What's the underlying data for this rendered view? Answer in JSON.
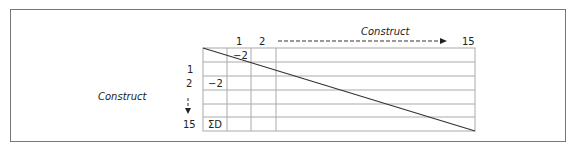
{
  "diagram": {
    "type": "matrix",
    "top_axis": {
      "title": "Construct",
      "column_labels": [
        "1",
        "2",
        "15"
      ],
      "arrow": "dashed-right"
    },
    "left_axis": {
      "title": "Construct",
      "row_labels": [
        "1",
        "2",
        "15"
      ],
      "arrow": "dashed-down"
    },
    "cells": {
      "r0_c0": "−2",
      "r2_c0": "−2",
      "r5_c0": "ΣD"
    },
    "diagonal": "line from top-left to bottom-right",
    "grid": {
      "rows": 6,
      "narrow_columns": 3,
      "wide_column": 1
    },
    "colors": {
      "line": "#333333",
      "grid": "#aaaaaa",
      "frame": "#777777"
    }
  }
}
